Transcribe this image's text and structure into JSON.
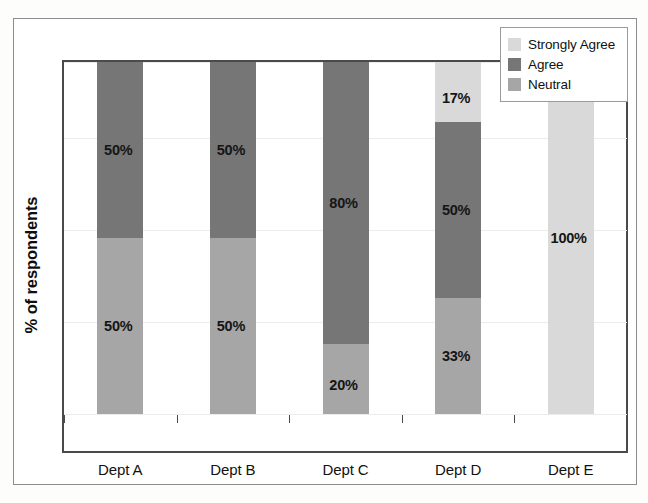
{
  "chart_data": {
    "type": "bar",
    "subtype": "stacked-bar-100-percent",
    "title": "",
    "xlabel": "",
    "ylabel": "% of respondents",
    "ylim": [
      0,
      100
    ],
    "grid": true,
    "gridlines_y": [
      0,
      25,
      50,
      75,
      100
    ],
    "legend_position": "top-right",
    "categories": [
      "Dept A",
      "Dept B",
      "Dept C",
      "Dept D",
      "Dept E"
    ],
    "series": [
      {
        "name": "Neutral",
        "color": "#a6a6a6",
        "values": [
          50,
          50,
          20,
          33,
          0
        ],
        "labels": [
          "50%",
          "50%",
          "20%",
          "33%",
          ""
        ]
      },
      {
        "name": "Agree",
        "color": "#767676",
        "values": [
          50,
          50,
          80,
          50,
          0
        ],
        "labels": [
          "50%",
          "50%",
          "80%",
          "50%",
          ""
        ]
      },
      {
        "name": "Strongly Agree",
        "color": "#d9d9d9",
        "values": [
          0,
          0,
          0,
          17,
          100
        ],
        "labels": [
          "",
          "",
          "",
          "17%",
          "100%"
        ]
      }
    ],
    "stack_order_bottom_to_top": [
      "Neutral",
      "Agree",
      "Strongly Agree"
    ]
  },
  "legend": {
    "items": [
      {
        "label": "Strongly Agree",
        "color": "#d9d9d9"
      },
      {
        "label": "Agree",
        "color": "#767676"
      },
      {
        "label": "Neutral",
        "color": "#a6a6a6"
      }
    ]
  },
  "axes": {
    "y_title": "% of respondents",
    "x_categories": [
      "Dept A",
      "Dept B",
      "Dept C",
      "Dept D",
      "Dept E"
    ]
  },
  "bars": [
    {
      "category": "Dept A",
      "segments": [
        {
          "series": "Neutral",
          "value": 50,
          "label": "50%",
          "color": "#a6a6a6"
        },
        {
          "series": "Agree",
          "value": 50,
          "label": "50%",
          "color": "#767676"
        }
      ]
    },
    {
      "category": "Dept B",
      "segments": [
        {
          "series": "Neutral",
          "value": 50,
          "label": "50%",
          "color": "#a6a6a6"
        },
        {
          "series": "Agree",
          "value": 50,
          "label": "50%",
          "color": "#767676"
        }
      ]
    },
    {
      "category": "Dept C",
      "segments": [
        {
          "series": "Neutral",
          "value": 20,
          "label": "20%",
          "color": "#a6a6a6"
        },
        {
          "series": "Agree",
          "value": 80,
          "label": "80%",
          "color": "#767676"
        }
      ]
    },
    {
      "category": "Dept D",
      "segments": [
        {
          "series": "Neutral",
          "value": 33,
          "label": "33%",
          "color": "#a6a6a6"
        },
        {
          "series": "Agree",
          "value": 50,
          "label": "50%",
          "color": "#767676"
        },
        {
          "series": "Strongly Agree",
          "value": 17,
          "label": "17%",
          "color": "#d9d9d9"
        }
      ]
    },
    {
      "category": "Dept E",
      "segments": [
        {
          "series": "Strongly Agree",
          "value": 100,
          "label": "100%",
          "color": "#d9d9d9"
        }
      ]
    }
  ]
}
